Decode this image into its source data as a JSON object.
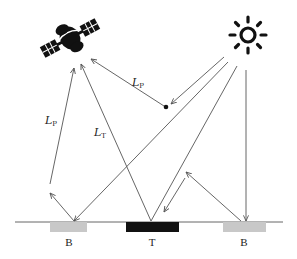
{
  "diagram": {
    "colors": {
      "line": "#555555",
      "ink": "#111111",
      "background_patch": "#c8c8c8",
      "target_patch": "#111111",
      "ground": "#666666"
    },
    "icons": {
      "satellite": "satellite-icon",
      "sun": "sun-icon",
      "particle": "atmospheric-particle-dot"
    },
    "labels": {
      "path_radiance_upper": {
        "main": "L",
        "sub": "P"
      },
      "path_radiance_left": {
        "main": "L",
        "sub": "P"
      },
      "target_radiance": {
        "main": "L",
        "sub": "T"
      }
    },
    "ground": {
      "patches": [
        {
          "id": "background-left",
          "label": "B"
        },
        {
          "id": "target",
          "label": "T"
        },
        {
          "id": "background-right",
          "label": "B"
        }
      ]
    }
  }
}
